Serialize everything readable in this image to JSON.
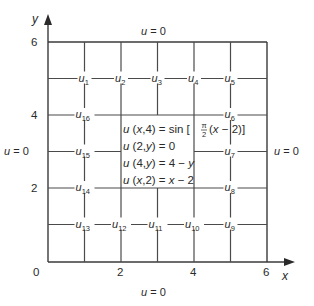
{
  "figure": {
    "type": "finite-difference-grid",
    "axes": {
      "x_label": "x",
      "y_label": "y",
      "x_ticks": [
        "0",
        "2",
        "4",
        "6"
      ],
      "y_ticks": [
        "6",
        "4",
        "2"
      ],
      "origin_label": "0"
    },
    "boundary_conditions": {
      "top": "u = 0",
      "bottom": "u = 0",
      "left": "u = 0",
      "right": "u = 0"
    },
    "interior_conditions": [
      {
        "lhs": "u (x,4) = sin [",
        "frac_num": "π",
        "frac_den": "2",
        "rhs": "(x − 2)]"
      },
      {
        "text": "u (2,y) = 0"
      },
      {
        "text": "u (4,y) = 4 − y"
      },
      {
        "text": "u (x,2) = x − 2"
      }
    ],
    "nodes": [
      {
        "base": "u",
        "sub": "1",
        "x": 1,
        "y": 5
      },
      {
        "base": "u",
        "sub": "2",
        "x": 2,
        "y": 5
      },
      {
        "base": "u",
        "sub": "3",
        "x": 3,
        "y": 5
      },
      {
        "base": "u",
        "sub": "4",
        "x": 4,
        "y": 5
      },
      {
        "base": "u",
        "sub": "5",
        "x": 5,
        "y": 5
      },
      {
        "base": "u",
        "sub": "6",
        "x": 5,
        "y": 4
      },
      {
        "base": "u",
        "sub": "7",
        "x": 5,
        "y": 3
      },
      {
        "base": "u",
        "sub": "8",
        "x": 5,
        "y": 2
      },
      {
        "base": "u",
        "sub": "9",
        "x": 5,
        "y": 1
      },
      {
        "base": "u",
        "sub": "10",
        "x": 4,
        "y": 1
      },
      {
        "base": "u",
        "sub": "11",
        "x": 3,
        "y": 1
      },
      {
        "base": "u",
        "sub": "12",
        "x": 2,
        "y": 1
      },
      {
        "base": "u",
        "sub": "13",
        "x": 1,
        "y": 1
      },
      {
        "base": "u",
        "sub": "14",
        "x": 1,
        "y": 2
      },
      {
        "base": "u",
        "sub": "15",
        "x": 1,
        "y": 3
      },
      {
        "base": "u",
        "sub": "16",
        "x": 1,
        "y": 4
      }
    ]
  }
}
